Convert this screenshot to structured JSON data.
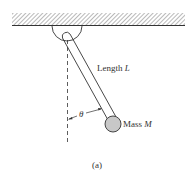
{
  "diagram": {
    "type": "pendulum",
    "labels": {
      "length_text": "Length ",
      "length_var": "L",
      "mass_text": "Mass ",
      "mass_var": "M",
      "angle": "θ",
      "caption": "(a)"
    },
    "colors": {
      "line": "#333333",
      "hatch": "#888888",
      "mass_fill": "#c8c8c8"
    }
  }
}
